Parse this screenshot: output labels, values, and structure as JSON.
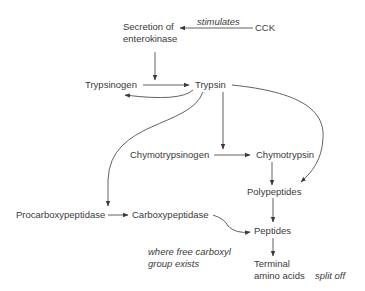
{
  "nodes": {
    "secretion": {
      "line1": "Secretion of",
      "line2": "enterokinase"
    },
    "cck": "CCK",
    "trypsinogen": "Trypsinogen",
    "trypsin": "Trypsin",
    "chymotrypsinogen": "Chymotrypsinogen",
    "chymotrypsin": "Chymotrypsin",
    "polypeptides": "Polypeptides",
    "procarboxypeptidase": "Procarboxypeptidase",
    "carboxypeptidase": "Carboxypeptidase",
    "peptides": "Peptides",
    "terminal": {
      "line1": "Terminal",
      "line2": "amino acids"
    }
  },
  "annotations": {
    "stimulates": "stimulates",
    "free_carboxyl": {
      "line1": "where free carboxyl",
      "line2": "group exists"
    },
    "split_off": "split off"
  },
  "colors": {
    "line": "#3a3a3a",
    "background": "#ffffff"
  }
}
